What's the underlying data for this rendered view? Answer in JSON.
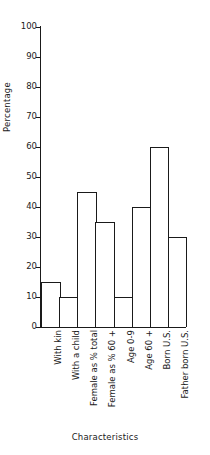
{
  "chart_data": {
    "type": "bar",
    "title": "",
    "xlabel": "Characteristics",
    "ylabel": "Percentage",
    "categories": [
      "With kin",
      "With a child",
      "Female as % total",
      "Female as % 60 +",
      "Age 0-9",
      "Age 60 +",
      "Born U.S.",
      "Father born U.S."
    ],
    "values": [
      15,
      10,
      45,
      35,
      10,
      40,
      60,
      30
    ],
    "ylim": [
      0,
      100
    ],
    "yticks": [
      0,
      10,
      20,
      30,
      40,
      50,
      60,
      70,
      80,
      90,
      100
    ],
    "ytick_labels": [
      "0",
      "10",
      "20",
      "30",
      "40",
      "50",
      "60",
      "70",
      "80",
      "90",
      "100"
    ],
    "grid": false,
    "legend": null,
    "bar_fill_color": "#ffffff",
    "bar_edge_color": "#1a1a1a",
    "axis_color": "#1a1a1a",
    "background_color": "#ffffff"
  }
}
